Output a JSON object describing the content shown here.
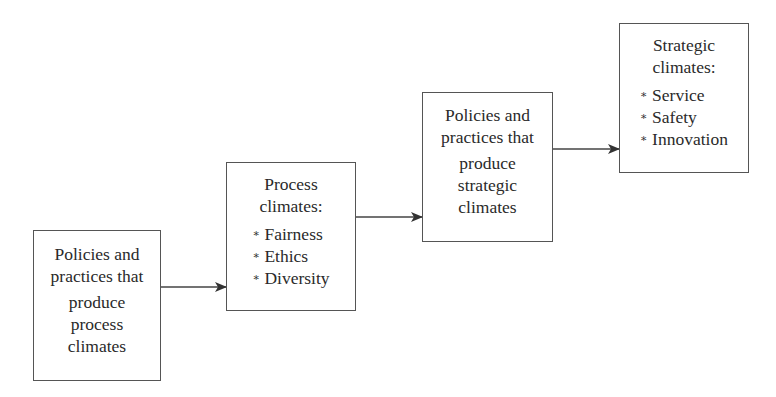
{
  "diagram": {
    "type": "flow",
    "direction": "left-to-right, ascending staircase",
    "boxes": [
      {
        "id": "box1",
        "heading_lines": [
          "Policies and",
          "practices that"
        ],
        "sub_lines": [
          "produce",
          "process",
          "climates"
        ]
      },
      {
        "id": "box2",
        "heading_lines": [
          "Process",
          "climates:"
        ],
        "bullets": [
          "Fairness",
          "Ethics",
          "Diversity"
        ]
      },
      {
        "id": "box3",
        "heading_lines": [
          "Policies and",
          "practices that"
        ],
        "sub_lines": [
          "produce",
          "strategic",
          "climates"
        ]
      },
      {
        "id": "box4",
        "heading_lines": [
          "Strategic",
          "climates:"
        ],
        "bullets": [
          "Service",
          "Safety",
          "Innovation"
        ]
      }
    ],
    "arrows": [
      {
        "from": "box1",
        "to": "box2"
      },
      {
        "from": "box2",
        "to": "box3"
      },
      {
        "from": "box3",
        "to": "box4"
      }
    ],
    "bullet_glyph": "∗",
    "colors": {
      "border": "#555555",
      "text": "#2a2a2a",
      "arrow": "#333333",
      "background": "#ffffff"
    }
  }
}
